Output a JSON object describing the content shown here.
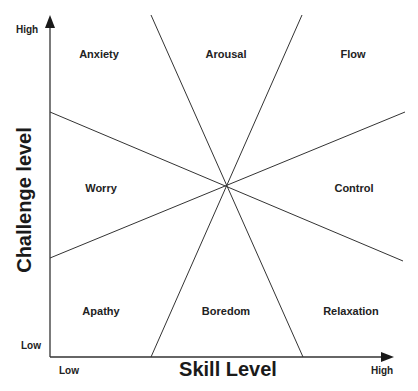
{
  "diagram": {
    "axes": {
      "x_title": "Skill Level",
      "y_title": "Challenge level",
      "x_low": "Low",
      "x_high": "High",
      "y_low": "Low",
      "y_high": "High"
    },
    "regions": [
      {
        "id": "anxiety",
        "label": "Anxiety"
      },
      {
        "id": "arousal",
        "label": "Arousal"
      },
      {
        "id": "flow",
        "label": "Flow"
      },
      {
        "id": "worry",
        "label": "Worry"
      },
      {
        "id": "control",
        "label": "Control"
      },
      {
        "id": "apathy",
        "label": "Apathy"
      },
      {
        "id": "boredom",
        "label": "Boredom"
      },
      {
        "id": "relaxation",
        "label": "Relaxation"
      }
    ],
    "colors": {
      "line": "#333333",
      "text": "#1a1a1a",
      "background": "#ffffff"
    }
  }
}
